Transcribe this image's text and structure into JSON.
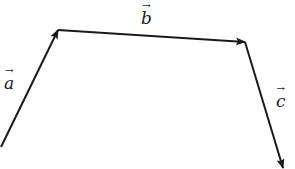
{
  "diagram": {
    "type": "vector-chain",
    "stroke_color": "#1a1a1a",
    "stroke_width": 2,
    "vectors": [
      {
        "name": "a",
        "label": "a",
        "arrow_glyph": "→",
        "from": [
          1,
          147
        ],
        "to": [
          58,
          30
        ],
        "label_pos": [
          4,
          68
        ]
      },
      {
        "name": "b",
        "label": "b",
        "arrow_glyph": "→",
        "from": [
          58,
          30
        ],
        "to": [
          245,
          42
        ],
        "label_pos": [
          141,
          3
        ]
      },
      {
        "name": "c",
        "label": "c",
        "arrow_glyph": "→",
        "from": [
          245,
          42
        ],
        "to": [
          283,
          168
        ],
        "label_pos": [
          276,
          86
        ]
      }
    ]
  }
}
